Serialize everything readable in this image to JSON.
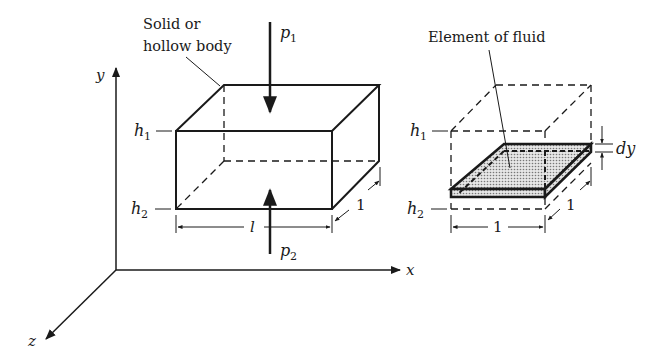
{
  "figure": {
    "left_body": {
      "callout": [
        "Solid or",
        "hollow body"
      ],
      "force_top": "p",
      "force_top_sub": "1",
      "force_bottom": "p",
      "force_bottom_sub": "2",
      "height_top": "h",
      "height_top_sub": "1",
      "height_bottom": "h",
      "height_bottom_sub": "2",
      "length_label": "l",
      "depth_label": "1"
    },
    "right_element": {
      "callout": "Element of fluid",
      "height_top": "h",
      "height_top_sub": "1",
      "height_bottom": "h",
      "height_bottom_sub": "2",
      "width_label": "1",
      "depth_label": "1",
      "thickness_label": "dy"
    },
    "axes": {
      "x": "x",
      "y": "y",
      "z": "z"
    }
  }
}
